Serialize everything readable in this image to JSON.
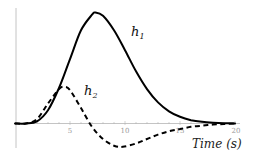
{
  "chart_data": {
    "type": "line",
    "title": "",
    "xlabel": "Time (s)",
    "ylabel": "",
    "xlim": [
      0,
      20
    ],
    "ylim": [
      -0.22,
      1.0
    ],
    "x_ticks": [
      "5",
      "10",
      "15",
      "20"
    ],
    "y_ticks": [],
    "grid": false,
    "legend": "inline labels",
    "series": [
      {
        "name": "h1",
        "label_main": "h",
        "label_sub": "1",
        "style": "solid",
        "color": "#000000",
        "x": [
          0,
          1,
          2,
          3,
          4,
          5,
          6,
          7,
          7.3,
          8,
          9,
          10,
          11,
          12,
          13,
          14,
          15,
          16,
          17,
          18,
          19,
          20
        ],
        "y": [
          0,
          0,
          0.02,
          0.12,
          0.32,
          0.58,
          0.84,
          0.98,
          1.0,
          0.97,
          0.84,
          0.66,
          0.47,
          0.31,
          0.19,
          0.11,
          0.06,
          0.03,
          0.015,
          0.007,
          0.003,
          0.0
        ]
      },
      {
        "name": "h2",
        "label_main": "h",
        "label_sub": "2",
        "style": "dashed",
        "color": "#000000",
        "x": [
          0,
          1,
          2,
          3,
          4,
          4.5,
          5,
          6,
          7,
          8,
          9,
          9.8,
          11,
          12,
          13,
          14,
          15,
          16,
          17,
          18,
          19,
          20
        ],
        "y": [
          0,
          0,
          0.04,
          0.18,
          0.31,
          0.33,
          0.3,
          0.14,
          -0.03,
          -0.14,
          -0.2,
          -0.21,
          -0.18,
          -0.14,
          -0.1,
          -0.07,
          -0.05,
          -0.03,
          -0.02,
          -0.01,
          -0.005,
          0.0
        ]
      }
    ]
  },
  "labels": {
    "tick_5": "5",
    "tick_10": "10",
    "tick_15": "15",
    "tick_20": "20",
    "xaxis_title": "Time (s)",
    "h1_main": "h",
    "h1_sub": "1",
    "h2_main": "h",
    "h2_sub": "2"
  }
}
